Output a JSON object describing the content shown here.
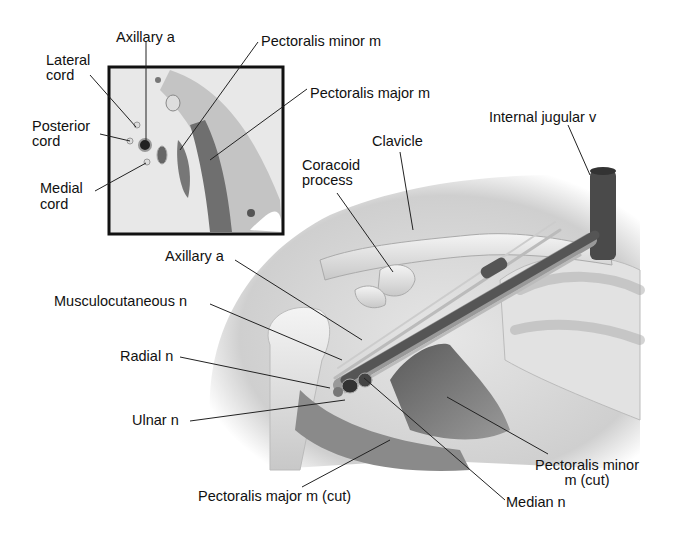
{
  "figure": {
    "inset": {
      "labels": {
        "axillary_a": "Axillary a",
        "lateral_cord": [
          "Lateral",
          "cord"
        ],
        "posterior_cord": [
          "Posterior",
          "cord"
        ],
        "medial_cord": [
          "Medial",
          "cord"
        ],
        "pectoralis_minor": "Pectoralis minor m",
        "pectoralis_major": "Pectoralis major m"
      }
    },
    "main": {
      "labels": {
        "internal_jugular": "Internal jugular v",
        "clavicle": "Clavicle",
        "coracoid": [
          "Coracoid",
          "process"
        ],
        "axillary_a": "Axillary a",
        "musculocutaneous": "Musculocutaneous n",
        "radial": "Radial n",
        "ulnar": "Ulnar n",
        "pectoralis_minor_cut": [
          "Pectoralis minor",
          "m (cut)"
        ],
        "pectoralis_major_cut": "Pectoralis major m (cut)",
        "median": "Median n"
      }
    },
    "colors": {
      "background": "#ffffff",
      "skin": "#d9d9d9",
      "muscle": "#6e6e6e",
      "vessel": "#4a4a4a",
      "bone": "#ececec",
      "frame": "#111111"
    }
  }
}
